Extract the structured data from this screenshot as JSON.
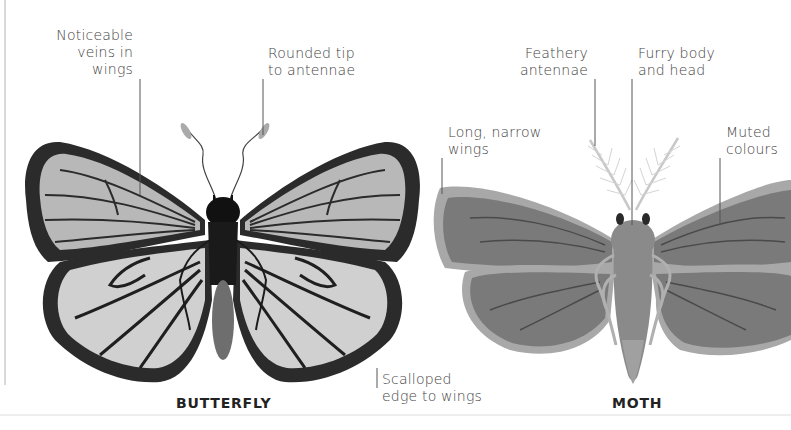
{
  "figure": {
    "butterfly": {
      "title": "BUTTERFLY",
      "annotations": {
        "veins": [
          "Noticeable",
          "veins in",
          "wings"
        ],
        "antennae": [
          "Rounded tip",
          "to antennae"
        ],
        "edge": [
          "Scalloped",
          "edge to wings"
        ]
      },
      "colors": {
        "wing_fill": "#b8b8b8",
        "wing_border": "#2b2b2b",
        "body": "#1a1a1a",
        "abdomen": "#6e6e6e"
      }
    },
    "moth": {
      "title": "MOTH",
      "annotations": {
        "antennae": [
          "Feathery",
          "antennae"
        ],
        "body": [
          "Furry body",
          "and head"
        ],
        "wings": [
          "Long, narrow",
          "wings"
        ],
        "colours": [
          "Muted",
          "colours"
        ]
      },
      "colors": {
        "wing_fill": "#7a7a7a",
        "wing_edge": "#a8a8a8",
        "body": "#8a8a8a",
        "antennae": "#c8c8c8"
      }
    }
  }
}
